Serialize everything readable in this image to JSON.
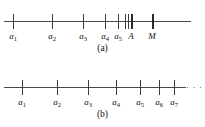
{
  "figure": {
    "panels": [
      {
        "id": "a",
        "caption": "(a)",
        "axis": {
          "x_start": 4,
          "x_end": 191,
          "y": 21
        },
        "ticks": [
          {
            "name": "a1",
            "label_main": "a",
            "label_sub": "1",
            "x": 13,
            "bold": false,
            "labeled": true
          },
          {
            "name": "a2",
            "label_main": "a",
            "label_sub": "2",
            "x": 52,
            "bold": false,
            "labeled": true
          },
          {
            "name": "a3",
            "label_main": "a",
            "label_sub": "3",
            "x": 83,
            "bold": false,
            "labeled": true
          },
          {
            "name": "a4",
            "label_main": "a",
            "label_sub": "4",
            "x": 105,
            "bold": false,
            "labeled": true
          },
          {
            "name": "a5",
            "label_main": "a",
            "label_sub": "5",
            "x": 118,
            "bold": false,
            "labeled": true
          },
          {
            "name": "a6",
            "label_main": "",
            "label_sub": "",
            "x": 125,
            "bold": false,
            "labeled": false
          },
          {
            "name": "a7",
            "label_main": "",
            "label_sub": "",
            "x": 127.5,
            "bold": false,
            "labeled": false
          },
          {
            "name": "accumulation-point-A",
            "label_main": "A",
            "label_sub": "",
            "x": 131,
            "bold": true,
            "labeled": true
          },
          {
            "name": "bound-M",
            "label_main": "M",
            "label_sub": "",
            "x": 152,
            "bold": true,
            "labeled": true
          }
        ],
        "ellipsis": null
      },
      {
        "id": "b",
        "caption": "(b)",
        "axis": {
          "x_start": 4,
          "x_end": 186,
          "y": 24
        },
        "ticks": [
          {
            "name": "a1",
            "label_main": "a",
            "label_sub": "1",
            "x": 22,
            "bold": false,
            "labeled": true
          },
          {
            "name": "a2",
            "label_main": "a",
            "label_sub": "2",
            "x": 57,
            "bold": false,
            "labeled": true
          },
          {
            "name": "a3",
            "label_main": "a",
            "label_sub": "3",
            "x": 88,
            "bold": false,
            "labeled": true
          },
          {
            "name": "a4",
            "label_main": "a",
            "label_sub": "4",
            "x": 116,
            "bold": false,
            "labeled": true
          },
          {
            "name": "a5",
            "label_main": "a",
            "label_sub": "5",
            "x": 140,
            "bold": false,
            "labeled": true
          },
          {
            "name": "a6",
            "label_main": "a",
            "label_sub": "6",
            "x": 159,
            "bold": false,
            "labeled": true
          },
          {
            "name": "a7",
            "label_main": "a",
            "label_sub": "7",
            "x": 174,
            "bold": false,
            "labeled": true
          }
        ],
        "ellipsis": {
          "text": "· · ·",
          "x": 186,
          "y": 20
        }
      }
    ]
  },
  "style": {
    "axis_color": "#4a4a4a",
    "tick_color": "#3a3a3a",
    "text_color": "#111111",
    "background": "#ffffff"
  }
}
